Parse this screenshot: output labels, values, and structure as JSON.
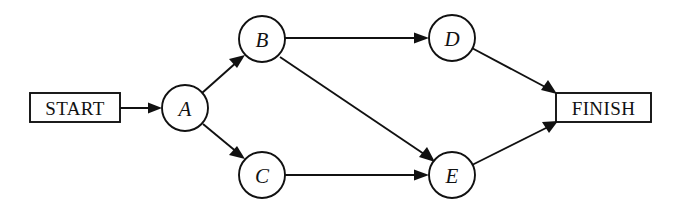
{
  "diagram": {
    "type": "activity-network-diagram",
    "title": "",
    "background_color": "#ffffff",
    "stroke_color": "#111111",
    "terminals": [
      {
        "id": "start",
        "label": "START",
        "shape": "rectangle",
        "x": 30,
        "y": 93,
        "width": 90,
        "height": 29
      },
      {
        "id": "finish",
        "label": "FINISH",
        "shape": "rectangle",
        "x": 556,
        "y": 93,
        "width": 95,
        "height": 29
      }
    ],
    "nodes": [
      {
        "id": "A",
        "label": "A",
        "shape": "circle",
        "cx": 185,
        "cy": 108,
        "r": 23
      },
      {
        "id": "B",
        "label": "B",
        "shape": "circle",
        "cx": 262,
        "cy": 39,
        "r": 23
      },
      {
        "id": "C",
        "label": "C",
        "shape": "circle",
        "cx": 262,
        "cy": 175,
        "r": 23
      },
      {
        "id": "D",
        "label": "D",
        "shape": "circle",
        "cx": 452,
        "cy": 38,
        "r": 23
      },
      {
        "id": "E",
        "label": "E",
        "shape": "circle",
        "cx": 452,
        "cy": 175,
        "r": 23
      }
    ],
    "edges": [
      {
        "id": "start-a",
        "from": "START",
        "to": "A",
        "x1": 120,
        "y1": 108,
        "x2": 162,
        "y2": 108,
        "arrow": true
      },
      {
        "id": "a-b",
        "from": "A",
        "to": "B",
        "x1": 202,
        "y1": 93,
        "x2": 244,
        "y2": 56,
        "arrow": true
      },
      {
        "id": "a-c",
        "from": "A",
        "to": "C",
        "x1": 203,
        "y1": 124,
        "x2": 244,
        "y2": 158,
        "arrow": true
      },
      {
        "id": "b-d",
        "from": "B",
        "to": "D",
        "x1": 285,
        "y1": 38,
        "x2": 429,
        "y2": 38,
        "arrow": true
      },
      {
        "id": "b-e",
        "from": "B",
        "to": "E",
        "x1": 280,
        "y1": 57,
        "x2": 434,
        "y2": 161,
        "arrow": true
      },
      {
        "id": "c-e",
        "from": "C",
        "to": "E",
        "x1": 285,
        "y1": 175,
        "x2": 429,
        "y2": 175,
        "arrow": true
      },
      {
        "id": "d-finish",
        "from": "D",
        "to": "FINISH",
        "x1": 470,
        "y1": 47,
        "x2": 556,
        "y2": 94,
        "arrow": true
      },
      {
        "id": "e-finish",
        "from": "E",
        "to": "FINISH",
        "x1": 470,
        "y1": 166,
        "x2": 557,
        "y2": 121,
        "arrow": true
      }
    ]
  }
}
